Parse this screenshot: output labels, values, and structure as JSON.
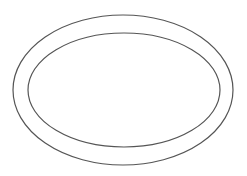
{
  "figure": {
    "background": "#ffffff",
    "stroke_color": "#555555",
    "shapes": [
      {
        "name": "outer-ellipse",
        "cx": 123,
        "cy": 90,
        "rx": 110,
        "ry": 75
      },
      {
        "name": "inner-ellipse",
        "cx": 124,
        "cy": 90,
        "rx": 96,
        "ry": 57
      }
    ]
  }
}
